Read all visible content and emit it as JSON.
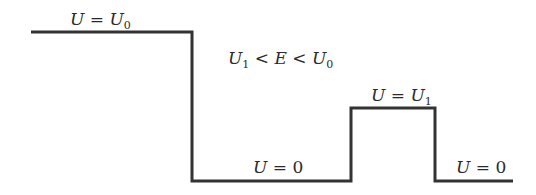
{
  "diagram": {
    "type": "potential-energy-profile",
    "line_color": "#333333",
    "line_width": 3,
    "path_points": [
      [
        31,
        32
      ],
      [
        192,
        32
      ],
      [
        192,
        181
      ],
      [
        351,
        181
      ],
      [
        351,
        108
      ],
      [
        435,
        108
      ],
      [
        435,
        181
      ],
      [
        513,
        181
      ]
    ],
    "labels": {
      "region1": {
        "var": "U",
        "eq": " = ",
        "rhs": "U",
        "rhs_sub": "0"
      },
      "condition": {
        "a": "U",
        "a_sub": "1",
        "lt1": " < ",
        "b": "E",
        "lt2": " < ",
        "c": "U",
        "c_sub": "0"
      },
      "region2": {
        "var": "U",
        "eq": " = ",
        "rhs": "0"
      },
      "barrier": {
        "var": "U",
        "eq": " = ",
        "rhs": "U",
        "rhs_sub": "1"
      },
      "region4": {
        "var": "U",
        "eq": " = ",
        "rhs": "0"
      }
    }
  }
}
